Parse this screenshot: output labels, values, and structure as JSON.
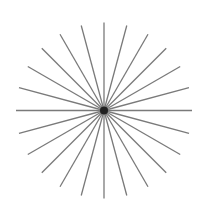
{
  "figure": {
    "type": "starburst",
    "center": [
      104,
      110.5
    ],
    "radius": 88,
    "ray_count": 24,
    "angle_step_deg": 15,
    "ray_color": "#7a7a7a",
    "ray_width": 1.3,
    "center_dot_color": "#111111",
    "background": "#ffffff"
  }
}
